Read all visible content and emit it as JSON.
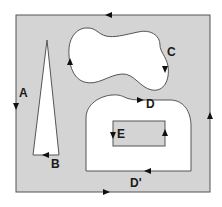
{
  "diagram": {
    "type": "contour-integration-regions",
    "colors": {
      "region_fill": "#d4d4d4",
      "hole_fill": "#ffffff",
      "stroke": "#555555",
      "arrow": "#111111",
      "label": "#1a1a1a"
    },
    "labels": {
      "A": "A",
      "B": "B",
      "C": "C",
      "D": "D",
      "D_prime": "D'",
      "E": "E"
    },
    "contours": [
      {
        "id": "A",
        "desc": "outer square boundary",
        "orientation": "counterclockwise"
      },
      {
        "id": "B",
        "desc": "thin triangle hole",
        "orientation": "clockwise"
      },
      {
        "id": "C",
        "desc": "dumbbell-shaped hole",
        "orientation": "clockwise"
      },
      {
        "id": "D",
        "desc": "top of arch-shaped hole",
        "orientation": "clockwise"
      },
      {
        "id": "D_prime",
        "desc": "bottom of arch-shaped hole",
        "orientation": "clockwise"
      },
      {
        "id": "E",
        "desc": "small rectangle region inside D hole",
        "orientation": "counterclockwise"
      }
    ]
  }
}
